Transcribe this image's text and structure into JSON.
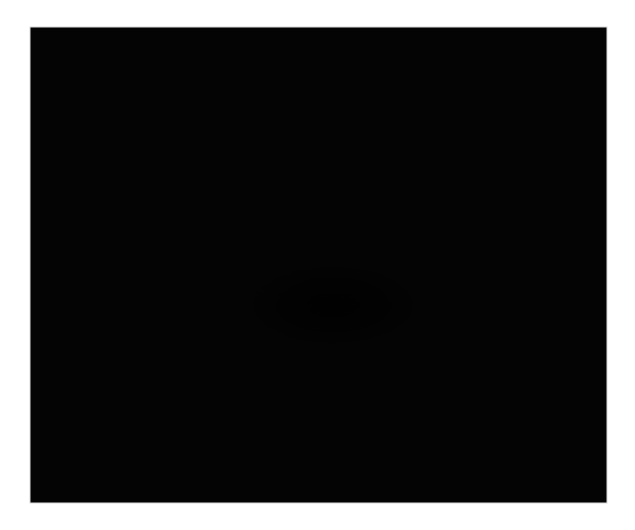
{
  "figure": {
    "kind": "spacetime-curvature-illustration",
    "title": "Gravitational lensing: light rays deflected by a massive body warping spacetime",
    "background_color": "#ffffff",
    "panel": {
      "name": "spacetime-grid-panel",
      "x": 30,
      "y": 27,
      "width": 577,
      "height": 476,
      "fill_color": "#040404",
      "border_color": "#d8d8d8"
    },
    "grid": {
      "name": "spacetime-grid",
      "description": "Perspective rubber-sheet grid depressed into a funnel around the central mass",
      "line_color": "#c6c6c6",
      "line_color_far": "#8a8a8a",
      "line_color_near": "#e8e8e8",
      "u_lines": 34,
      "v_lines": 30,
      "perspective": "rows compress toward the top (far) and expand toward the bottom (near)",
      "well": {
        "center_x": 333,
        "center_y": 300,
        "radius": 150,
        "depth": 86
      }
    },
    "sphere": {
      "name": "massive-body-sphere",
      "label": "massive body",
      "center_x": 334,
      "center_y": 247,
      "radius_x": 61,
      "radius_y": 69,
      "fill_color": "#3b3b3b",
      "shade_light": "#6e6e6e",
      "shade_dark": "#141414",
      "wireframe_color": "#9a9a9a",
      "latitude_rings": 22,
      "longitude_lines": 60,
      "pole_x": 334,
      "pole_y": 198
    },
    "rays": [
      {
        "name": "light-ray-left",
        "label": "deflected light ray (left)",
        "color": "#f2f2f2",
        "width": 3.0,
        "start_x": 186,
        "start_y": 498,
        "end_x": 297,
        "end_y": 48,
        "bend": "curves toward the mass near mid-height",
        "arrowhead": {
          "x": 297,
          "y": 48,
          "angle_deg": -76
        }
      },
      {
        "name": "light-ray-right",
        "label": "deflected light ray (right)",
        "color": "#f2f2f2",
        "width": 3.0,
        "start_x": 387,
        "start_y": 504,
        "end_x": 414,
        "end_y": 50,
        "bend": "near-vertical, slightly deflected toward the mass",
        "arrowhead": {
          "x": 414,
          "y": 50,
          "angle_deg": -87
        }
      }
    ]
  }
}
